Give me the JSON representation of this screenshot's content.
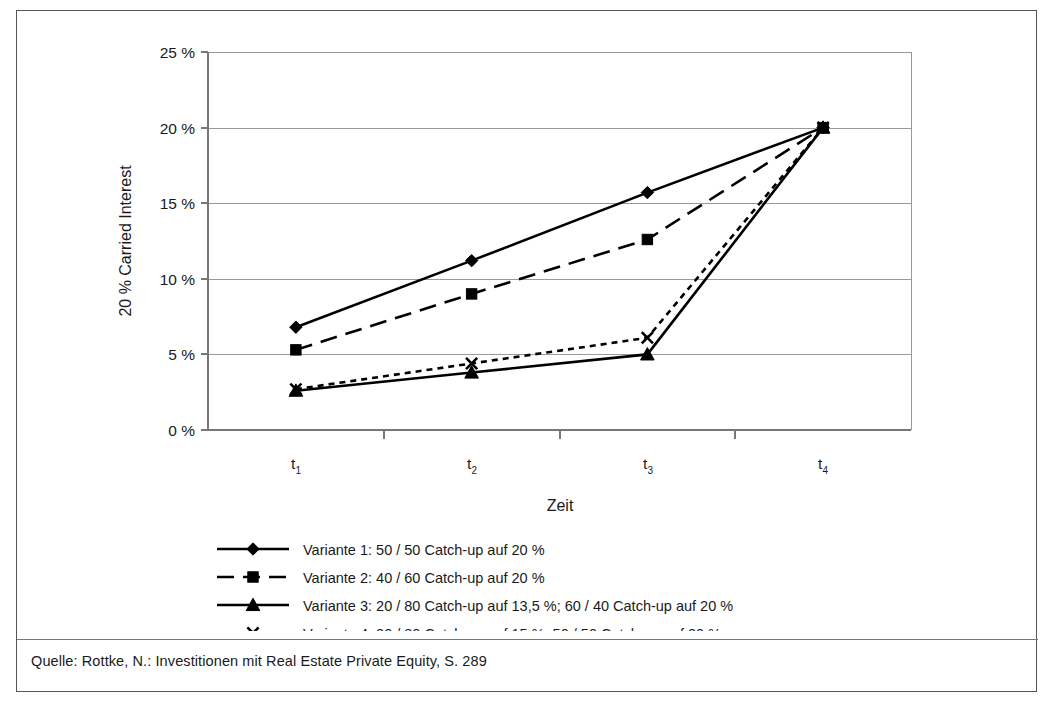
{
  "figure": {
    "source_note": "Quelle: Rottke, N.: Investitionen mit Real Estate Private Equity, S. 289"
  },
  "chart_data": {
    "type": "line",
    "title": "",
    "xlabel": "Zeit",
    "ylabel": "20 % Carried Interest",
    "categories": [
      "t1",
      "t2",
      "t3",
      "t4"
    ],
    "category_labels": [
      {
        "base": "t",
        "sub": "1"
      },
      {
        "base": "t",
        "sub": "2"
      },
      {
        "base": "t",
        "sub": "3"
      },
      {
        "base": "t",
        "sub": "4"
      }
    ],
    "ylim": [
      0,
      25
    ],
    "ytick_values": [
      0,
      5,
      10,
      15,
      20,
      25
    ],
    "ytick_labels": [
      "0 %",
      "5 %",
      "10 %",
      "15 %",
      "20 %",
      "25 %"
    ],
    "grid": true,
    "legend_position": "bottom-left",
    "series": [
      {
        "name": "Variante 1: 50 / 50 Catch-up auf 20 %",
        "marker": "diamond",
        "linestyle": "solid",
        "color": "#000000",
        "values": [
          6.8,
          11.2,
          15.7,
          20.0
        ]
      },
      {
        "name": "Variante 2: 40 / 60 Catch-up auf 20 %",
        "marker": "square",
        "linestyle": "dashed",
        "color": "#000000",
        "values": [
          5.3,
          9.0,
          12.6,
          20.0
        ]
      },
      {
        "name": "Variante 3: 20 / 80 Catch-up auf 13,5 %; 60 / 40 Catch-up auf 20 %",
        "marker": "triangle",
        "linestyle": "solid",
        "color": "#000000",
        "values": [
          2.6,
          3.8,
          5.0,
          20.0
        ]
      },
      {
        "name": "Variante 4: 20 / 80 Catch-up auf 15 %; 50 / 50 Catch-up auf 20 %",
        "marker": "x",
        "linestyle": "dotted",
        "color": "#000000",
        "values": [
          2.7,
          4.4,
          6.1,
          20.0
        ]
      }
    ]
  }
}
